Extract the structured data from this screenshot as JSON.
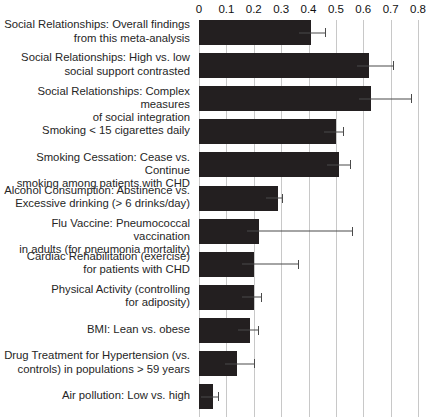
{
  "chart_data": {
    "type": "bar",
    "orientation": "horizontal",
    "title": "",
    "subtitle": "",
    "xlabel": "",
    "ylabel": "",
    "xlim": [
      0,
      0.8
    ],
    "xticks": [
      0,
      0.1,
      0.2,
      0.3,
      0.4,
      0.5,
      0.6,
      0.7,
      0.8
    ],
    "xtick_labels": [
      "0",
      "0.1",
      "0.2",
      "0.3",
      "0.4",
      "0.5",
      "0.6",
      "0.7",
      "0.8"
    ],
    "grid": true,
    "grid_axis": "x",
    "legend": null,
    "legend_position": "none",
    "bar_color": "#231f20",
    "errorbar_color": "#4a4a4a",
    "gridline_color": "#c8c8c8",
    "background_color": "#ffffff",
    "categories": [
      "Social Relationships: Overall findings\nfrom this meta-analysis",
      "Social Relationships: High vs. low\nsocial support contrasted",
      "Social Relationships: Complex measures\nof social integration",
      "Smoking < 15 cigarettes daily",
      "Smoking Cessation: Cease vs. Continue\nsmoking among patients with CHD",
      "Alcohol Consumption: Abstinence vs.\nExcessive drinking (> 6 drinks/day)",
      "Flu Vaccine: Pneumococcal vaccination\nin adults (for pneumonia mortality)",
      "Cardiac Rehabilitation (exercise)\nfor patients with CHD",
      "Physical Activity (controlling\nfor adiposity)",
      "BMI: Lean vs. obese",
      "Drug Treatment for Hypertension (vs.\ncontrols) in populations > 59 years",
      "Air pollution: Low vs. high"
    ],
    "values": [
      0.41,
      0.62,
      0.63,
      0.5,
      0.51,
      0.29,
      0.22,
      0.2,
      0.2,
      0.185,
      0.14,
      0.05
    ],
    "error_high": [
      0.46,
      0.71,
      0.775,
      0.525,
      0.55,
      0.305,
      0.56,
      0.36,
      0.225,
      0.215,
      0.2,
      0.07
    ],
    "error_low": [
      0.41,
      0.62,
      0.63,
      0.5,
      0.51,
      0.29,
      0.22,
      0.2,
      0.2,
      0.185,
      0.14,
      0.05
    ]
  }
}
